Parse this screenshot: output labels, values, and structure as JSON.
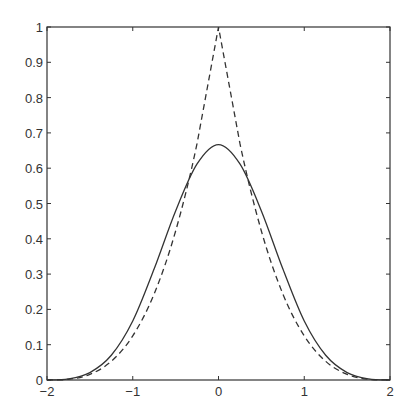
{
  "chart_data": {
    "type": "line",
    "title": "",
    "xlabel": "",
    "ylabel": "",
    "xlim": [
      -2,
      2
    ],
    "ylim": [
      0,
      1
    ],
    "grid": false,
    "legend": null,
    "xticks": [
      -2,
      -1,
      0,
      1,
      2
    ],
    "xtick_labels": [
      "-2",
      "-1",
      "0",
      "1",
      "2"
    ],
    "yticks": [
      0,
      0.1,
      0.2,
      0.3,
      0.4,
      0.5,
      0.6,
      0.7,
      0.8,
      0.9,
      1
    ],
    "ytick_labels": [
      "0",
      "0.1",
      "0.2",
      "0.3",
      "0.4",
      "0.5",
      "0.6",
      "0.7",
      "0.8",
      "0.9",
      "1"
    ],
    "series": [
      {
        "name": "solid",
        "style": "solid",
        "x": [
          -2,
          -1.75,
          -1.5,
          -1.25,
          -1,
          -0.75,
          -0.5,
          -0.25,
          0,
          0.25,
          0.5,
          0.75,
          1,
          1.25,
          1.5,
          1.75,
          2
        ],
        "values": [
          0,
          0.003,
          0.021,
          0.07,
          0.167,
          0.315,
          0.479,
          0.612,
          0.667,
          0.612,
          0.479,
          0.315,
          0.167,
          0.07,
          0.021,
          0.003,
          0
        ]
      },
      {
        "name": "dashed",
        "style": "dashed",
        "x": [
          -2,
          -1.75,
          -1.5,
          -1.25,
          -1,
          -0.75,
          -0.5,
          -0.25,
          0,
          0.25,
          0.5,
          0.75,
          1,
          1.25,
          1.5,
          1.75,
          2
        ],
        "values": [
          0,
          0.002,
          0.016,
          0.053,
          0.125,
          0.244,
          0.422,
          0.67,
          1,
          0.67,
          0.422,
          0.244,
          0.125,
          0.053,
          0.016,
          0.002,
          0
        ]
      }
    ]
  }
}
